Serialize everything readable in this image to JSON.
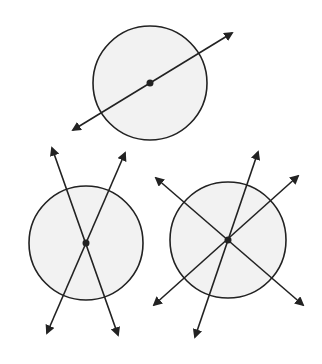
{
  "diagram": {
    "colors": {
      "background": "#ffffff",
      "circle_fill": "#f2f2f2",
      "stroke": "#222222"
    },
    "figures": [
      {
        "name": "circle-one-line",
        "center": [
          150,
          83
        ],
        "radius": 57,
        "lines": [
          {
            "from": [
              73,
              130
            ],
            "to": [
              232,
              33
            ]
          }
        ]
      },
      {
        "name": "circle-two-lines",
        "center": [
          86,
          243
        ],
        "radius": 57,
        "lines": [
          {
            "from": [
              118,
              335
            ],
            "to": [
              52,
              148
            ]
          },
          {
            "from": [
              47,
              333
            ],
            "to": [
              125,
              153
            ]
          }
        ]
      },
      {
        "name": "circle-three-lines",
        "center": [
          228,
          240
        ],
        "radius": 58,
        "lines": [
          {
            "from": [
              303,
              305
            ],
            "to": [
              156,
              178
            ]
          },
          {
            "from": [
              154,
              305
            ],
            "to": [
              298,
              176
            ]
          },
          {
            "from": [
              195,
              337
            ],
            "to": [
              258,
              152
            ]
          }
        ]
      }
    ]
  }
}
